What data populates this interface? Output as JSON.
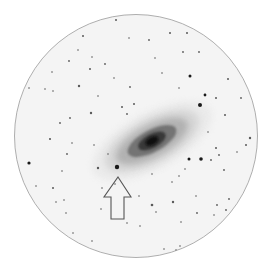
{
  "image": {
    "description": "Inverted (negative) telescope eyepiece view of a spiral galaxy with surrounding field stars, arrow pointing to a bright star below the galaxy",
    "background": "#ffffff",
    "field_fill": "#f4f4f4",
    "field_edge": "#9a9a9a"
  },
  "field_of_view": {
    "cx": 136,
    "cy": 136,
    "r": 121.5
  },
  "galaxy": {
    "cx": 152,
    "cy": 141,
    "angle": -28,
    "layers": [
      {
        "rx": 66,
        "ry": 28,
        "color": "#e2e2e2",
        "opacity": 0.55
      },
      {
        "rx": 52,
        "ry": 22,
        "color": "#c9c9c9",
        "opacity": 0.6
      },
      {
        "rx": 40,
        "ry": 16,
        "color": "#9e9e9e",
        "opacity": 0.65
      },
      {
        "rx": 27,
        "ry": 11,
        "color": "#5e5e5e",
        "opacity": 0.75
      },
      {
        "rx": 15,
        "ry": 7,
        "color": "#2e2e2e",
        "opacity": 0.85
      },
      {
        "rx": 7,
        "ry": 4,
        "color": "#111111",
        "opacity": 0.95
      }
    ]
  },
  "arrow": {
    "points": "118,177 131,197 124,197 124,219 111,219 111,197 104,197",
    "stroke": "#555555"
  },
  "stars": [
    [
      117,
      167,
      2.2
    ],
    [
      200,
      105,
      2.0
    ],
    [
      205,
      95,
      1.4
    ],
    [
      190,
      76,
      1.5
    ],
    [
      201,
      159,
      1.8
    ],
    [
      189,
      159,
      1.5
    ],
    [
      29,
      163,
      1.6
    ],
    [
      79,
      86,
      1.2
    ],
    [
      91,
      113,
      1.2
    ],
    [
      50,
      139,
      1.1
    ],
    [
      98,
      168,
      1.2
    ],
    [
      152,
      205,
      1.3
    ],
    [
      173,
      202,
      1.2
    ],
    [
      225,
      115,
      1.0
    ],
    [
      216,
      98,
      1.0
    ],
    [
      83,
      36,
      1.0
    ],
    [
      116,
      20,
      1.0
    ],
    [
      170,
      33,
      1.0
    ],
    [
      187,
      33,
      1.0
    ],
    [
      149,
      40,
      0.9
    ],
    [
      183,
      52,
      0.9
    ],
    [
      199,
      52,
      0.9
    ],
    [
      228,
      79,
      1.0
    ],
    [
      241,
      98,
      0.9
    ],
    [
      250,
      138,
      1.2
    ],
    [
      246,
      145,
      1.0
    ],
    [
      216,
      148,
      1.0
    ],
    [
      219,
      155,
      0.9
    ],
    [
      224,
      170,
      0.9
    ],
    [
      211,
      160,
      0.9
    ],
    [
      90,
      69,
      1.0
    ],
    [
      69,
      61,
      0.9
    ],
    [
      92,
      57,
      0.8
    ],
    [
      78,
      50,
      0.8
    ],
    [
      105,
      64,
      0.9
    ],
    [
      114,
      78,
      0.8
    ],
    [
      130,
      87,
      0.9
    ],
    [
      134,
      104,
      1.0
    ],
    [
      122,
      107,
      1.0
    ],
    [
      127,
      114,
      0.9
    ],
    [
      53,
      91,
      0.8
    ],
    [
      45,
      89,
      0.8
    ],
    [
      29,
      88,
      0.8
    ],
    [
      60,
      123,
      0.9
    ],
    [
      70,
      118,
      0.9
    ],
    [
      72,
      143,
      0.8
    ],
    [
      67,
      154,
      0.9
    ],
    [
      62,
      171,
      0.8
    ],
    [
      53,
      188,
      1.0
    ],
    [
      56,
      202,
      0.8
    ],
    [
      64,
      200,
      0.8
    ],
    [
      66,
      213,
      0.8
    ],
    [
      36,
      186,
      0.8
    ],
    [
      101,
      209,
      0.8
    ],
    [
      139,
      196,
      0.8
    ],
    [
      156,
      212,
      0.8
    ],
    [
      140,
      226,
      0.8
    ],
    [
      181,
      222,
      0.8
    ],
    [
      197,
      213,
      0.9
    ],
    [
      217,
      205,
      0.9
    ],
    [
      214,
      215,
      0.8
    ],
    [
      226,
      210,
      0.9
    ],
    [
      229,
      199,
      0.9
    ],
    [
      196,
      196,
      0.8
    ],
    [
      152,
      174,
      0.8
    ],
    [
      185,
      169,
      0.8
    ],
    [
      179,
      176,
      0.8
    ],
    [
      172,
      182,
      0.8
    ],
    [
      102,
      188,
      0.8
    ],
    [
      108,
      154,
      0.8
    ],
    [
      94,
      145,
      0.8
    ],
    [
      115,
      184,
      0.8
    ],
    [
      127,
      223,
      0.8
    ],
    [
      180,
      246,
      0.8
    ],
    [
      176,
      250,
      0.8
    ],
    [
      164,
      249,
      0.8
    ],
    [
      73,
      233,
      0.8
    ],
    [
      92,
      241,
      0.8
    ],
    [
      129,
      38,
      0.8
    ],
    [
      155,
      58,
      0.8
    ],
    [
      162,
      73,
      0.8
    ],
    [
      179,
      88,
      0.8
    ],
    [
      208,
      132,
      0.8
    ],
    [
      237,
      152,
      0.8
    ],
    [
      52,
      72,
      0.8
    ],
    [
      98,
      96,
      0.8
    ]
  ]
}
